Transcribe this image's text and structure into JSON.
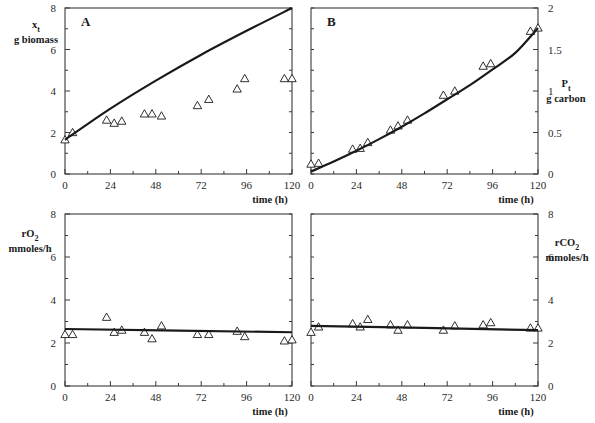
{
  "chart_data": [
    {
      "panel": "A",
      "type": "scatter",
      "title": "A",
      "xlabel": "time (h)",
      "ylabel": "x_t g biomass",
      "ylabel_main": "x",
      "ylabel_sub": "t",
      "ylabel_unit": "g biomass",
      "xlim": [
        0,
        120
      ],
      "ylim": [
        0,
        8
      ],
      "xticks": [
        0,
        24,
        48,
        72,
        96,
        120
      ],
      "yticks": [
        0,
        2,
        4,
        6,
        8
      ],
      "y_axis_side": "left",
      "grid": false,
      "series": [
        {
          "name": "observed",
          "marker": "triangle-open",
          "x": [
            0,
            4,
            22,
            26,
            30,
            42,
            46,
            51,
            70,
            76,
            91,
            95,
            116,
            120
          ],
          "y": [
            1.65,
            2.0,
            2.6,
            2.45,
            2.55,
            2.9,
            2.9,
            2.8,
            3.3,
            3.6,
            4.1,
            4.6,
            4.6,
            4.6
          ]
        },
        {
          "name": "model",
          "line": "solid",
          "x": [
            0,
            24,
            48,
            72,
            96,
            120
          ],
          "y": [
            1.65,
            3.15,
            4.5,
            5.75,
            6.9,
            8.0
          ]
        }
      ]
    },
    {
      "panel": "B",
      "type": "scatter",
      "title": "B",
      "xlabel": "time (h)",
      "ylabel": "P_t g carbon",
      "ylabel_main": "P",
      "ylabel_sub": "t",
      "ylabel_unit": "g carbon",
      "xlim": [
        0,
        120
      ],
      "ylim": [
        0,
        2
      ],
      "xticks": [
        0,
        24,
        48,
        72,
        96,
        120
      ],
      "yticks": [
        0,
        0.5,
        1,
        1.5,
        2
      ],
      "ytick_labels": [
        "0",
        "0.5",
        "1",
        "1.5",
        "2"
      ],
      "y_axis_side": "right",
      "grid": false,
      "series": [
        {
          "name": "observed",
          "marker": "triangle-open",
          "x": [
            0,
            4,
            22,
            26,
            30,
            42,
            46,
            51,
            70,
            76,
            91,
            95,
            116,
            120
          ],
          "y": [
            0.12,
            0.13,
            0.3,
            0.31,
            0.38,
            0.53,
            0.58,
            0.65,
            0.95,
            1.0,
            1.3,
            1.33,
            1.72,
            1.76
          ]
        },
        {
          "name": "model",
          "line": "solid",
          "x": [
            0,
            12,
            24,
            36,
            48,
            60,
            72,
            84,
            96,
            108,
            120
          ],
          "y": [
            0.03,
            0.15,
            0.28,
            0.42,
            0.57,
            0.73,
            0.9,
            1.07,
            1.26,
            1.46,
            1.76
          ]
        }
      ]
    },
    {
      "panel": "rO2",
      "type": "scatter",
      "title": "",
      "xlabel": "time (h)",
      "ylabel": "rO2 mmoles/h",
      "ylabel_main": "rO",
      "ylabel_sub": "2",
      "ylabel_unit": "mmoles/h",
      "xlim": [
        0,
        120
      ],
      "ylim": [
        0,
        8
      ],
      "xticks": [
        0,
        24,
        48,
        72,
        96,
        120
      ],
      "yticks": [
        0,
        2,
        4,
        6,
        8
      ],
      "y_axis_side": "left",
      "grid": false,
      "series": [
        {
          "name": "observed",
          "marker": "triangle-open",
          "x": [
            0,
            4,
            22,
            26,
            30,
            42,
            46,
            51,
            70,
            76,
            91,
            95,
            116,
            120
          ],
          "y": [
            2.4,
            2.4,
            3.2,
            2.5,
            2.6,
            2.5,
            2.2,
            2.8,
            2.4,
            2.4,
            2.55,
            2.3,
            2.1,
            2.15
          ]
        },
        {
          "name": "model",
          "line": "solid",
          "x": [
            0,
            120
          ],
          "y": [
            2.65,
            2.5
          ]
        }
      ]
    },
    {
      "panel": "rCO2",
      "type": "scatter",
      "title": "",
      "xlabel": "time (h)",
      "ylabel": "rCO2 mmoles/h",
      "ylabel_main": "rCO",
      "ylabel_sub": "2",
      "ylabel_unit": "mmoles/h",
      "xlim": [
        0,
        120
      ],
      "ylim": [
        0,
        8
      ],
      "xticks": [
        0,
        24,
        48,
        72,
        96,
        120
      ],
      "yticks": [
        0,
        2,
        4,
        6,
        8
      ],
      "y_axis_side": "right",
      "grid": false,
      "series": [
        {
          "name": "observed",
          "marker": "triangle-open",
          "x": [
            0,
            4,
            22,
            26,
            30,
            42,
            46,
            51,
            70,
            76,
            91,
            95,
            116,
            120
          ],
          "y": [
            2.5,
            2.75,
            2.9,
            2.75,
            3.1,
            2.85,
            2.6,
            2.85,
            2.6,
            2.8,
            2.85,
            2.95,
            2.7,
            2.7
          ]
        },
        {
          "name": "model",
          "line": "solid",
          "x": [
            0,
            120
          ],
          "y": [
            2.8,
            2.6
          ]
        }
      ]
    }
  ],
  "colors": {
    "ink": "#1a1a1a",
    "axis": "#3a3a3a",
    "background": "#ffffff"
  }
}
